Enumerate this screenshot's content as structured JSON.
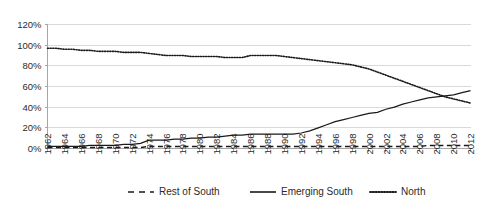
{
  "chart_data": {
    "type": "line",
    "title": "",
    "xlabel": "",
    "ylabel": "",
    "ylim": [
      0,
      120
    ],
    "ytick_labels": [
      "0%",
      "20%",
      "40%",
      "60%",
      "80%",
      "100%",
      "120%"
    ],
    "ytick_values": [
      0,
      20,
      40,
      60,
      80,
      100,
      120
    ],
    "grid": true,
    "legend_position": "bottom",
    "x": [
      1962,
      1963,
      1964,
      1965,
      1966,
      1967,
      1968,
      1969,
      1970,
      1971,
      1972,
      1973,
      1974,
      1975,
      1976,
      1977,
      1978,
      1979,
      1980,
      1981,
      1982,
      1983,
      1984,
      1985,
      1986,
      1987,
      1988,
      1989,
      1990,
      1991,
      1992,
      1993,
      1994,
      1995,
      1996,
      1997,
      1998,
      1999,
      2000,
      2001,
      2002,
      2003,
      2004,
      2005,
      2006,
      2007,
      2008,
      2009,
      2010,
      2011,
      2012
    ],
    "xtick_labels": [
      "1962",
      "1964",
      "1966",
      "1968",
      "1970",
      "1972",
      "1974",
      "1976",
      "1978",
      "1980",
      "1982",
      "1984",
      "1986",
      "1988",
      "1990",
      "1992",
      "1994",
      "1996",
      "1998",
      "2000",
      "2002",
      "2004",
      "2006",
      "2008",
      "2010",
      "2012"
    ],
    "xtick_values": [
      1962,
      1964,
      1966,
      1968,
      1970,
      1972,
      1974,
      1976,
      1978,
      1980,
      1982,
      1984,
      1986,
      1988,
      1990,
      1992,
      1994,
      1996,
      1998,
      2000,
      2002,
      2004,
      2006,
      2008,
      2010,
      2012
    ],
    "series": [
      {
        "name": "Rest of South",
        "style": "dashed",
        "values": [
          1,
          1,
          1,
          1,
          1,
          1,
          1,
          1,
          1,
          1,
          1,
          1,
          2,
          2,
          2,
          2,
          2,
          2,
          2,
          2,
          2,
          2,
          2,
          2,
          2,
          2,
          2,
          2,
          2,
          2,
          2,
          2,
          2,
          2,
          2,
          2,
          2,
          2,
          2,
          2,
          2,
          2,
          2,
          2,
          2,
          3,
          3,
          3,
          3,
          3,
          3
        ]
      },
      {
        "name": "Emerging South",
        "style": "solid",
        "values": [
          2,
          2,
          2,
          2,
          2,
          3,
          3,
          3,
          3,
          4,
          4,
          5,
          8,
          8,
          8,
          9,
          9,
          10,
          10,
          11,
          11,
          12,
          13,
          13,
          14,
          14,
          14,
          14,
          14,
          14,
          15,
          17,
          20,
          23,
          26,
          28,
          30,
          32,
          34,
          35,
          38,
          40,
          43,
          45,
          47,
          49,
          50,
          51,
          52,
          54,
          56
        ]
      },
      {
        "name": "North",
        "style": "dotted",
        "values": [
          97,
          97,
          96,
          96,
          95,
          95,
          94,
          94,
          94,
          93,
          93,
          93,
          92,
          91,
          90,
          90,
          90,
          89,
          89,
          89,
          89,
          88,
          88,
          88,
          90,
          90,
          90,
          90,
          89,
          88,
          87,
          86,
          85,
          84,
          83,
          82,
          81,
          79,
          77,
          74,
          71,
          68,
          65,
          62,
          59,
          56,
          53,
          50,
          48,
          46,
          44
        ]
      }
    ]
  },
  "legend": {
    "items": [
      {
        "label": "Rest of South",
        "style": "dashed"
      },
      {
        "label": "Emerging South",
        "style": "solid"
      },
      {
        "label": "North",
        "style": "dotted"
      }
    ]
  }
}
